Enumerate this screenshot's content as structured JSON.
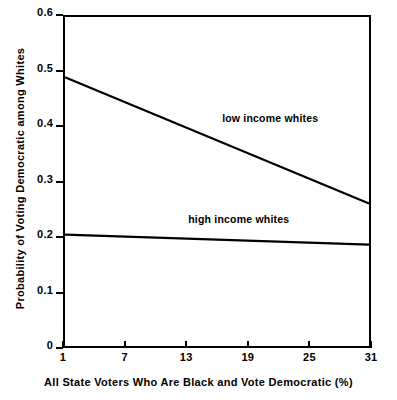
{
  "chart_data": {
    "type": "line",
    "title": "",
    "subtitle": "",
    "xlabel": "All State Voters Who Are Black and Vote Democratic (%)",
    "ylabel": "Probability of Voting Democratic among Whites",
    "xlim": [
      1,
      31
    ],
    "ylim": [
      0,
      0.6
    ],
    "xticks": [
      1,
      7,
      13,
      19,
      25,
      31
    ],
    "xticklabels": [
      "1",
      "7",
      "13",
      "19",
      "25",
      "31"
    ],
    "yticks": [
      0,
      0.1,
      0.2,
      0.3,
      0.4,
      0.5,
      0.6
    ],
    "yticklabels": [
      "0",
      "0.1",
      "0.2",
      "0.3",
      "0.4",
      "0.5",
      "0.6"
    ],
    "grid": false,
    "legend_position": "inline-annotation",
    "line_color": "#000000",
    "background_color": "#ffffff",
    "series": [
      {
        "name": "low income whites",
        "x": [
          1,
          31
        ],
        "values": [
          0.49,
          0.26
        ],
        "annotation": "low income whites",
        "annotation_x": 16.5,
        "annotation_y": 0.415
      },
      {
        "name": "high income whites",
        "x": [
          1,
          31
        ],
        "values": [
          0.203,
          0.185
        ],
        "annotation": "high income whites",
        "annotation_x": 13.2,
        "annotation_y": 0.232
      }
    ]
  }
}
